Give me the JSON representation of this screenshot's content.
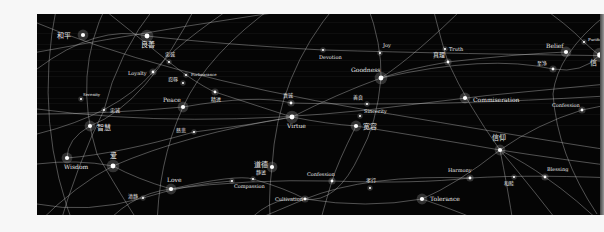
{
  "figure": {
    "background_color": "#050505",
    "line_color": "#bfbfbf",
    "node_color": "#ffffff",
    "text_color": "#e8e8e8"
  },
  "nodes": [
    {
      "id": "heping",
      "label": "和平",
      "x": 46,
      "y": 21,
      "size": 3,
      "lx": -26,
      "ly": 3,
      "fs": 7
    },
    {
      "id": "liangjie",
      "label": "良善",
      "x": 110,
      "y": 22,
      "size": 3.5,
      "lx": -6,
      "ly": 11,
      "fs": 7
    },
    {
      "id": "devotion",
      "label": "Devotion",
      "x": 286,
      "y": 36,
      "size": 1.5,
      "lx": -4,
      "ly": 9,
      "fs": 5
    },
    {
      "id": "joy",
      "label": "Joy",
      "x": 343,
      "y": 39,
      "size": 1.5,
      "lx": 3,
      "ly": -6,
      "fs": 5
    },
    {
      "id": "truth",
      "label": "Truth",
      "x": 408,
      "y": 35,
      "size": 1.5,
      "lx": 4,
      "ly": 2,
      "fs": 5
    },
    {
      "id": "zhenli",
      "label": "真理",
      "x": 411,
      "y": 48,
      "size": 2,
      "lx": -15,
      "ly": -5,
      "fs": 6
    },
    {
      "id": "goodness",
      "label": "Goodness",
      "x": 344,
      "y": 64,
      "size": 3.5,
      "lx": -30,
      "ly": -6,
      "fs": 6
    },
    {
      "id": "belief",
      "label": "Belief",
      "x": 529,
      "y": 38,
      "size": 3,
      "lx": -20,
      "ly": -4,
      "fs": 6
    },
    {
      "id": "purification",
      "label": "Purification",
      "x": 547,
      "y": 28,
      "size": 1.5,
      "lx": 4,
      "ly": -1,
      "fs": 4
    },
    {
      "id": "xin",
      "label": "信",
      "x": 563,
      "y": 41,
      "size": 4,
      "lx": -10,
      "ly": 10,
      "fs": 7
    },
    {
      "id": "zhijing",
      "label": "至净",
      "x": 516,
      "y": 55,
      "size": 2,
      "lx": -16,
      "ly": -4,
      "fs": 5
    },
    {
      "id": "loyalty",
      "label": "Loyalty",
      "x": 116,
      "y": 58,
      "size": 2,
      "lx": -25,
      "ly": 3,
      "fs": 5
    },
    {
      "id": "zhongcheng",
      "label": "忠诚",
      "x": 132,
      "y": 48,
      "size": 1.5,
      "lx": -4,
      "ly": -6,
      "fs": 5
    },
    {
      "id": "forbearance",
      "label": "Forbearance",
      "x": 149,
      "y": 61,
      "size": 1.5,
      "lx": 5,
      "ly": 1,
      "fs": 4
    },
    {
      "id": "renrou",
      "label": "忍辱",
      "x": 146,
      "y": 69,
      "size": 1.5,
      "lx": -15,
      "ly": -2,
      "fs": 5
    },
    {
      "id": "jingyi",
      "label": "精进",
      "x": 178,
      "y": 78,
      "size": 2,
      "lx": -4,
      "ly": 9,
      "fs": 5
    },
    {
      "id": "peace",
      "label": "Peace",
      "x": 146,
      "y": 93,
      "size": 3,
      "lx": -20,
      "ly": -5,
      "fs": 6
    },
    {
      "id": "serenity",
      "label": "Serenity",
      "x": 44,
      "y": 85,
      "size": 1.5,
      "lx": 2,
      "ly": -3,
      "fs": 4
    },
    {
      "id": "zhongcheng2",
      "label": "忠诚",
      "x": 67,
      "y": 96,
      "size": 1.5,
      "lx": 6,
      "ly": 2,
      "fs": 5
    },
    {
      "id": "zhihui",
      "label": "智慧",
      "x": 53,
      "y": 112,
      "size": 3,
      "lx": 7,
      "ly": 4,
      "fs": 7
    },
    {
      "id": "cibei",
      "label": "慈悲",
      "x": 157,
      "y": 118,
      "size": 1.5,
      "lx": -18,
      "ly": 0,
      "fs": 5
    },
    {
      "id": "wisdom",
      "label": "Wisdom",
      "x": 30,
      "y": 144,
      "size": 3,
      "lx": -3,
      "ly": 11,
      "fs": 6
    },
    {
      "id": "ai",
      "label": "爱",
      "x": 76,
      "y": 152,
      "size": 3.5,
      "lx": -3,
      "ly": -8,
      "fs": 7
    },
    {
      "id": "love",
      "label": "Love",
      "x": 134,
      "y": 175,
      "size": 3,
      "lx": -4,
      "ly": -7,
      "fs": 6
    },
    {
      "id": "qingjing",
      "label": "清静",
      "x": 106,
      "y": 184,
      "size": 1.5,
      "lx": -15,
      "ly": 0,
      "fs": 5
    },
    {
      "id": "guangai",
      "label": "真诚",
      "x": 254,
      "y": 89,
      "size": 2,
      "lx": -8,
      "ly": -6,
      "fs": 5
    },
    {
      "id": "virtue",
      "label": "Virtue",
      "x": 255,
      "y": 103,
      "size": 3.5,
      "lx": -5,
      "ly": 11,
      "fs": 6
    },
    {
      "id": "shanliang",
      "label": "善良",
      "x": 330,
      "y": 90,
      "size": 1.5,
      "lx": -14,
      "ly": -5,
      "fs": 5
    },
    {
      "id": "sincerity",
      "label": "Sincerity",
      "x": 323,
      "y": 102,
      "size": 1.5,
      "lx": 4,
      "ly": -3,
      "fs": 5
    },
    {
      "id": "kuanrong",
      "label": "宽容",
      "x": 319,
      "y": 112,
      "size": 3,
      "lx": 7,
      "ly": 3,
      "fs": 7
    },
    {
      "id": "commiseration",
      "label": "Commiseration",
      "x": 428,
      "y": 84,
      "size": 3,
      "lx": 8,
      "ly": 4,
      "fs": 6
    },
    {
      "id": "confession1",
      "label": "Confession",
      "x": 545,
      "y": 96,
      "size": 2,
      "lx": -30,
      "ly": -3,
      "fs": 5
    },
    {
      "id": "xinyang",
      "label": "信仰",
      "x": 463,
      "y": 136,
      "size": 3,
      "lx": -8,
      "ly": -10,
      "fs": 7
    },
    {
      "id": "harmony",
      "label": "Harmony",
      "x": 433,
      "y": 164,
      "size": 2,
      "lx": -22,
      "ly": -6,
      "fs": 5
    },
    {
      "id": "hemu",
      "label": "和睦",
      "x": 477,
      "y": 163,
      "size": 1.5,
      "lx": -10,
      "ly": 8,
      "fs": 5
    },
    {
      "id": "blessing",
      "label": "Blessing",
      "x": 508,
      "y": 163,
      "size": 2,
      "lx": 2,
      "ly": -6,
      "fs": 5
    },
    {
      "id": "tolerance",
      "label": "Tolerance",
      "x": 385,
      "y": 185,
      "size": 3,
      "lx": 8,
      "ly": 2,
      "fs": 6
    },
    {
      "id": "daode",
      "label": "道德",
      "x": 235,
      "y": 153,
      "size": 3,
      "lx": -18,
      "ly": 0,
      "fs": 7
    },
    {
      "id": "jingjin",
      "label": "静谧",
      "x": 216,
      "y": 165,
      "size": 1.5,
      "lx": 3,
      "ly": -5,
      "fs": 5
    },
    {
      "id": "compassion",
      "label": "Compassion",
      "x": 195,
      "y": 167,
      "size": 1.5,
      "lx": 2,
      "ly": 7,
      "fs": 5
    },
    {
      "id": "confession2",
      "label": "Confession",
      "x": 295,
      "y": 167,
      "size": 2,
      "lx": -25,
      "ly": -5,
      "fs": 5
    },
    {
      "id": "xiaoxiang",
      "label": "孝行",
      "x": 333,
      "y": 174,
      "size": 1.5,
      "lx": -4,
      "ly": -6,
      "fs": 5
    },
    {
      "id": "cultivation",
      "label": "Cultivation",
      "x": 268,
      "y": 185,
      "size": 2,
      "lx": -30,
      "ly": 2,
      "fs": 5
    }
  ],
  "curves": [
    "M -10 5 Q 120 60 330 96 T 600 140",
    "M -10 40 Q 150 10 300 -10",
    "M 20 -10 Q -5 110 40 220",
    "M 70 -10 Q 35 60 60 140 Q 95 200 110 220",
    "M 0 95 Q 150 115 330 96 Q 450 80 570 70",
    "M 120 -10 Q 80 40 67 96 Q 40 150 20 220",
    "M 0 55 Q 60 10 110 22 Q 180 30 286 36 Q 420 40 600 42",
    "M 0 100 Q 70 100 146 93 Q 220 80 254 89 Q 300 90 330 90 Q 450 90 600 80",
    "M 60 -10 Q 110 30 132 48 L 149 61 Q 170 75 178 78 Q 230 95 255 103 Q 290 110 319 112 Q 400 125 463 136 Q 520 145 600 155",
    "M 0 120 Q 80 100 116 58 Q 140 30 200 -10",
    "M 240 -10 Q 170 40 146 93 Q 120 150 120 220",
    "M 300 -10 Q 240 60 235 153 Q 230 190 235 220",
    "M 330 -10 Q 345 30 344 64 Q 340 110 323 140 Q 300 190 268 185 Q 230 180 200 220",
    "M 395 -10 Q 405 30 411 48 Q 430 90 463 136 Q 500 180 530 220",
    "M 0 210 Q 40 170 76 152 Q 150 120 255 103 Q 300 80 344 64 Q 450 40 516 55 Q 545 60 563 41",
    "M 0 150 Q 40 145 76 152 Q 100 165 134 175 Q 210 165 295 167 Q 380 170 433 164 Q 500 160 600 165",
    "M 30 144 Q 80 140 157 118 Q 220 110 255 103",
    "M 60 220 Q 90 180 134 175 Q 200 160 216 165 Q 250 175 268 185 Q 330 195 385 185 Q 420 170 463 136 Q 500 110 545 96 L 600 85",
    "M 190 220 Q 230 200 268 185 Q 330 160 433 164",
    "M 160 -10 Q 110 90 53 112 Q 30 125 30 144",
    "M 430 -10 Q 380 40 344 64",
    "M 500 -10 Q 530 10 547 28 Q 560 40 563 41",
    "M 570 0 Q 520 40 516 80 Q 520 140 560 200",
    "M 529 38 Q 480 40 411 48 Q 370 55 344 64",
    "M 463 136 Q 490 150 508 163 Q 540 185 570 215",
    "M 463 136 Q 470 170 477 215",
    "M 319 112 Q 300 150 295 167 Q 285 200 280 220",
    "M 385 185 Q 430 200 460 215",
    "M 0 190 Q 50 200 106 184 Q 150 170 195 167"
  ],
  "chart_data": {
    "type": "network",
    "title": "",
    "node_labels_english": [
      "Devotion",
      "Joy",
      "Truth",
      "Goodness",
      "Belief",
      "Purification",
      "Loyalty",
      "Forbearance",
      "Peace",
      "Serenity",
      "Wisdom",
      "Love",
      "Virtue",
      "Sincerity",
      "Commiseration",
      "Confession",
      "Harmony",
      "Blessing",
      "Tolerance",
      "Compassion",
      "Cultivation"
    ],
    "node_labels_chinese": [
      "和平",
      "良善",
      "真理",
      "信",
      "至净",
      "忠诚",
      "忍辱",
      "精进",
      "智慧",
      "慈悲",
      "爱",
      "清静",
      "真诚",
      "善良",
      "宽容",
      "信仰",
      "和睦",
      "道德",
      "静谧",
      "孝行"
    ]
  }
}
